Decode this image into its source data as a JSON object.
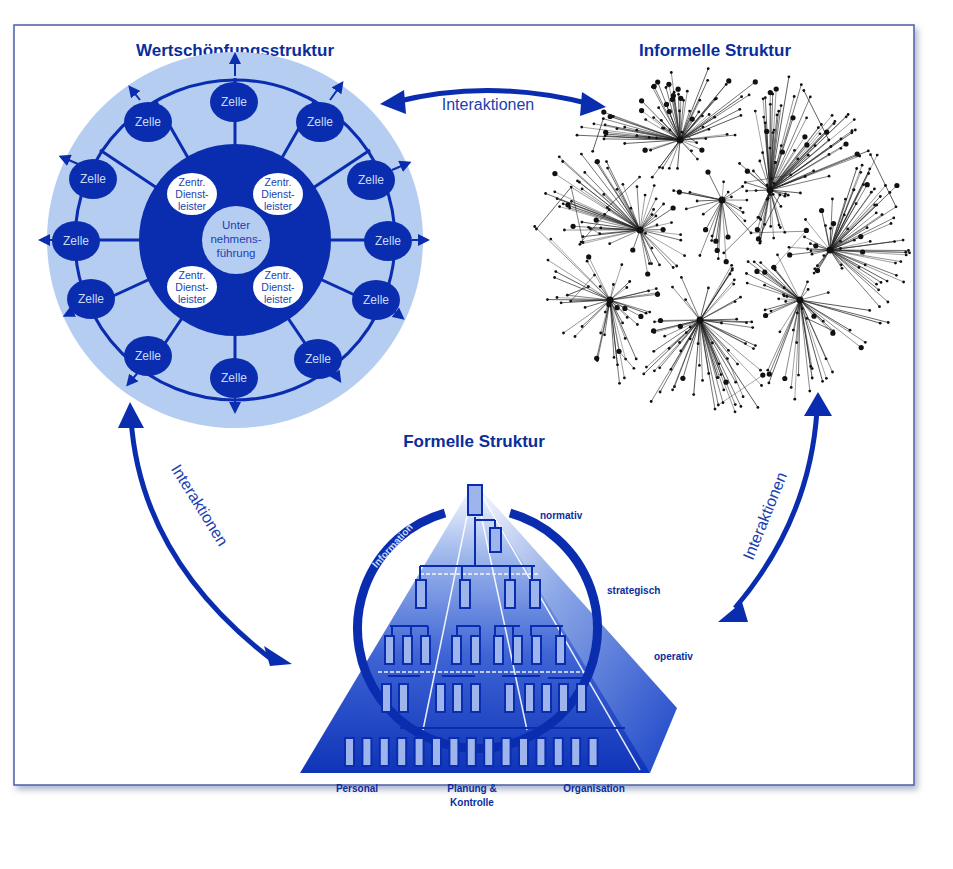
{
  "colors": {
    "dark_blue": "#0a2db0",
    "mid_blue": "#1b44c8",
    "light_blue": "#b6cdf2",
    "title_blue": "#0a2d9e",
    "frame": "#4a5fa8",
    "network": "#222222"
  },
  "value_structure": {
    "title": "Wertschöpfungsstruktur",
    "cell_label": "Zelle",
    "cell_count": 12,
    "service_label_lines": [
      "Zentr.",
      "Dienst-",
      "leister"
    ],
    "service_count": 4,
    "center_lines": [
      "Unter",
      "nehmens-",
      "führung"
    ]
  },
  "informal_structure": {
    "title": "Informelle Struktur"
  },
  "formal_structure": {
    "title": "Formelle Struktur",
    "levels": [
      "normativ",
      "strategisch",
      "operativ"
    ],
    "information_label": "Information",
    "functions": {
      "personal": "Personal",
      "planning_line1": "Planung &",
      "planning_line2": "Kontrolle",
      "organisation": "Organisation"
    }
  },
  "interactions": {
    "top": "Interaktionen",
    "left": "Interaktionen",
    "right": "Interaktionen"
  }
}
